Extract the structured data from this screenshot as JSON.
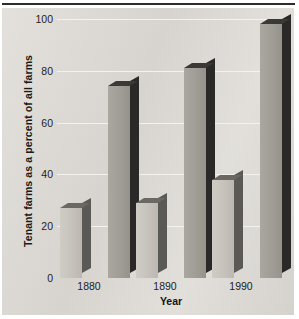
{
  "chart_data": {
    "type": "bar",
    "title": "",
    "xlabel": "Year",
    "ylabel": "Tenant farms as a percent of all farms",
    "categories": [
      "1880",
      "1890",
      "1990"
    ],
    "ylim": [
      0,
      100
    ],
    "yticks": [
      0,
      20,
      40,
      60,
      80,
      100
    ],
    "ytick_labels": [
      "0",
      "20",
      "40",
      "60",
      "80",
      "100"
    ],
    "grid": true,
    "legend": "none",
    "style": "3d-grouped-bar",
    "series": [
      {
        "name": "series-light",
        "values": [
          27,
          29,
          38
        ],
        "color": "#c6c2bb"
      },
      {
        "name": "series-dark",
        "values": [
          74,
          81,
          98
        ],
        "color": "#a09c96"
      }
    ],
    "bars": [
      {
        "category": "1880",
        "series": "series-light",
        "value": 27
      },
      {
        "category": "1880",
        "series": "series-dark",
        "value": 74
      },
      {
        "category": "1890",
        "series": "series-light",
        "value": 29
      },
      {
        "category": "1890",
        "series": "series-dark",
        "value": 81
      },
      {
        "category": "1990",
        "series": "series-light",
        "value": 38
      },
      {
        "category": "1990",
        "series": "series-dark",
        "value": 98
      }
    ]
  },
  "colors": {
    "panel_background": "#dedbd6",
    "gridline": "#f4f2ef",
    "text": "#1a1a1a",
    "top_rule": "#2c2c2c",
    "light_bar_face": "#c6c2bb",
    "light_bar_shadow": "#5b5955",
    "dark_bar_face": "#a09c96",
    "dark_bar_shadow": "#2a2927"
  }
}
